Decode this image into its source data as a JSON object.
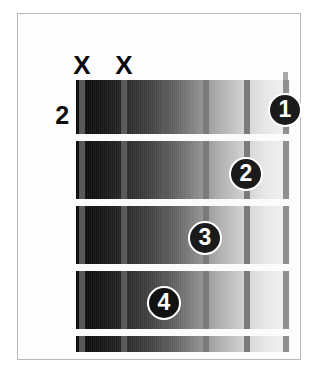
{
  "diagram": {
    "type": "guitar-chord-diagram",
    "starting_fret_label": "2",
    "string_count": 6,
    "fret_count": 4,
    "colors": {
      "frame_border": "#b9b9b9",
      "background": "#ffffff",
      "fret_line": "#fbfbfb",
      "string": "#7b7b7b",
      "marker_fill": "#1b1b1b",
      "marker_text": "#ffffff",
      "mute_marker": "#0a0a0a",
      "board_dark": "#0b0b0b",
      "board_light": "#f2f2f2"
    },
    "muted_strings": [
      {
        "label": "X",
        "string": 1,
        "left": 52
      },
      {
        "label": "X",
        "string": 2,
        "left": 94
      }
    ],
    "strings": [
      {
        "index": 1,
        "left": 3,
        "shade": "dark"
      },
      {
        "index": 2,
        "left": 45,
        "shade": "dark"
      },
      {
        "index": 3,
        "left": 86,
        "shade": "dark"
      },
      {
        "index": 4,
        "left": 127,
        "shade": ""
      },
      {
        "index": 5,
        "left": 168,
        "shade": ""
      },
      {
        "index": 6,
        "left": 207,
        "shade": "light"
      }
    ],
    "fret_lines": [
      {
        "index": 1,
        "top": 54
      },
      {
        "index": 2,
        "top": 119
      },
      {
        "index": 3,
        "top": 184
      },
      {
        "index": 4,
        "top": 249
      }
    ],
    "finger_markers": [
      {
        "finger": "1",
        "string": 6,
        "fret": 1,
        "left": 250,
        "top": 79,
        "on_dark": false
      },
      {
        "finger": "2",
        "string": 5,
        "fret": 2,
        "left": 211,
        "top": 143,
        "on_dark": false
      },
      {
        "finger": "3",
        "string": 4,
        "fret": 3,
        "left": 170,
        "top": 207,
        "on_dark": false
      },
      {
        "finger": "4",
        "string": 3,
        "fret": 4,
        "left": 129,
        "top": 272,
        "on_dark": true
      }
    ]
  }
}
